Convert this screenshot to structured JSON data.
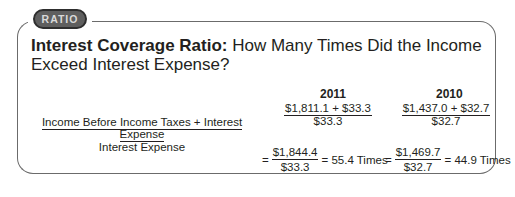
{
  "badge": {
    "label": "RATIO"
  },
  "title": {
    "bold": "Interest Coverage Ratio:",
    "rest": " How Many Times Did the Income Exceed Interest Expense?"
  },
  "formula": {
    "numerator": "Income Before Income Taxes + Interest Expense",
    "denominator": "Interest Expense"
  },
  "columns": [
    {
      "year": "2011",
      "step1": {
        "numerator": "$1,811.1 + $33.3",
        "denominator": "$33.3"
      },
      "step2": {
        "equals": "=",
        "numerator": "$1,844.4",
        "denominator": "$33.3",
        "result": "= 55.4 Times"
      }
    },
    {
      "year": "2010",
      "step1": {
        "numerator": "$1,437.0 + $32.7",
        "denominator": "$32.7"
      },
      "step2": {
        "equals": "=",
        "numerator": "$1,469.7",
        "denominator": "$32.7",
        "result": "= 44.9 Times"
      }
    }
  ]
}
